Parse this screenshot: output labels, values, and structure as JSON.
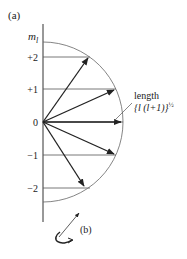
{
  "figure": {
    "panel_a_label": "(a)",
    "panel_b_label": "(b)",
    "axis_label": "m",
    "axis_label_sub": "l",
    "ticks": [
      {
        "label": "+2",
        "m": 2
      },
      {
        "label": "+1",
        "m": 1
      },
      {
        "label": "0",
        "m": 0
      },
      {
        "label": "−1",
        "m": -1
      },
      {
        "label": "−2",
        "m": -2
      }
    ],
    "annotation_line1": "length",
    "annotation_line2": "{l (l+1)}",
    "annotation_exp": "½",
    "colors": {
      "stroke": "#222222",
      "arc": "#555555"
    }
  }
}
